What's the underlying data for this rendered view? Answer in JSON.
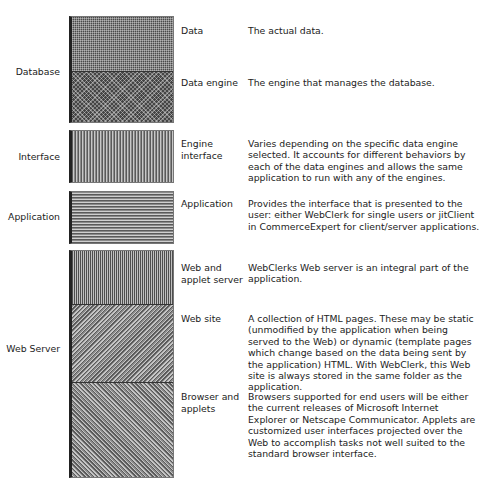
{
  "diagram": {
    "groups": [
      {
        "label": "Database",
        "components": [
          {
            "name": "Data",
            "description": "The actual data."
          },
          {
            "name": "Data engine",
            "description": "The engine that manages the database."
          }
        ]
      },
      {
        "label": "Interface",
        "components": [
          {
            "name": "Engine interface",
            "description": "Varies depending on the specific data engine selected. It accounts for different behaviors by each of the data engines and allows the same application to run with any of the engines."
          }
        ]
      },
      {
        "label": "Application",
        "components": [
          {
            "name": "Application",
            "description": "Provides the interface that is presented to the user: either WebClerk for single users or jitClient in CommerceExpert for client/server applications."
          }
        ]
      },
      {
        "label": "Web Server",
        "components": [
          {
            "name": "Web and applet server",
            "description": "WebClerks Web server is an integral part of the application."
          },
          {
            "name": "Web site",
            "description": "A collection of HTML pages. These may be static (unmodified by the application when being served to the Web) or dynamic (template pages which change based on the data being sent by the application) HTML. With WebClerk, this Web site is always stored in the same folder as the application."
          },
          {
            "name": "Browser and applets",
            "description": "Browsers supported for end users will be either the current releases of Microsoft Internet Explorer or Netscape Communicator. Applets are customized user interfaces projected over the Web to accomplish tasks not well suited to the standard browser interface."
          }
        ]
      }
    ],
    "caption": ""
  }
}
